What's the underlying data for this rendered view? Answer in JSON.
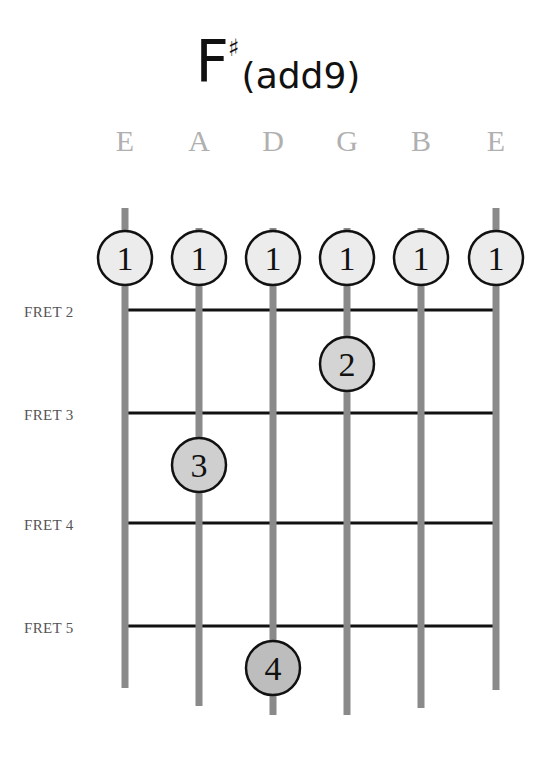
{
  "chord": {
    "root": "F",
    "accidental": "♯",
    "suffix": "(add9)"
  },
  "strings": [
    {
      "name": "E",
      "x": 125,
      "top": 208,
      "bottom": 688
    },
    {
      "name": "A",
      "x": 199,
      "top": 228,
      "bottom": 706
    },
    {
      "name": "D",
      "x": 273,
      "top": 228,
      "bottom": 715
    },
    {
      "name": "G",
      "x": 347,
      "top": 228,
      "bottom": 715
    },
    {
      "name": "B",
      "x": 421,
      "top": 228,
      "bottom": 708
    },
    {
      "name": "E",
      "x": 496,
      "top": 208,
      "bottom": 690
    }
  ],
  "frets": [
    {
      "label": "FRET 2",
      "y": 310
    },
    {
      "label": "FRET 3",
      "y": 413
    },
    {
      "label": "FRET 4",
      "y": 523
    },
    {
      "label": "FRET 5",
      "y": 626
    }
  ],
  "fingers": [
    {
      "finger": "1",
      "string": 0,
      "x": 125,
      "y": 258,
      "fill": "#ececec"
    },
    {
      "finger": "1",
      "string": 1,
      "x": 199,
      "y": 258,
      "fill": "#ececec"
    },
    {
      "finger": "1",
      "string": 2,
      "x": 273,
      "y": 258,
      "fill": "#ececec"
    },
    {
      "finger": "1",
      "string": 3,
      "x": 347,
      "y": 258,
      "fill": "#ececec"
    },
    {
      "finger": "1",
      "string": 4,
      "x": 421,
      "y": 258,
      "fill": "#ececec"
    },
    {
      "finger": "1",
      "string": 5,
      "x": 496,
      "y": 258,
      "fill": "#ececec"
    },
    {
      "finger": "2",
      "string": 3,
      "x": 347,
      "y": 364,
      "fill": "#d4d4d4"
    },
    {
      "finger": "3",
      "string": 1,
      "x": 199,
      "y": 465,
      "fill": "#cfcfcf"
    },
    {
      "finger": "4",
      "string": 2,
      "x": 273,
      "y": 668,
      "fill": "#bdbdbd"
    }
  ],
  "colors": {
    "string": "#8a8a8a",
    "fret": "#111111",
    "string_label": "#b0b0b0",
    "circle_stroke": "#111111"
  }
}
